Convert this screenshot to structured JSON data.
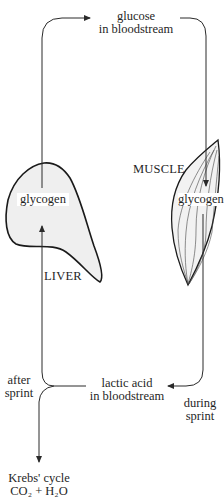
{
  "diagram": {
    "type": "Cori cycle",
    "colors": {
      "line": "#2a2a2a",
      "organ_fill": "#efefef",
      "background": "#ffffff"
    },
    "nodes": {
      "glucose": {
        "line1": "glucose",
        "line2": "in bloodstream"
      },
      "liver_glycogen": "glycogen",
      "liver_label": "LIVER",
      "muscle_label": "MUSCLE",
      "muscle_glycogen": "glycogen",
      "lactic_acid": {
        "line1": "lactic acid",
        "line2": "in bloodstream"
      },
      "krebs": {
        "line1": "Krebs' cycle",
        "line2": "CO₂ + H₂O"
      }
    },
    "edge_labels": {
      "after_sprint": {
        "line1": "after",
        "line2": "sprint"
      },
      "during_sprint": {
        "line1": "during",
        "line2": "sprint"
      }
    },
    "edges": [
      {
        "from": "liver_glycogen",
        "to": "glucose"
      },
      {
        "from": "glucose",
        "to": "muscle_glycogen"
      },
      {
        "from": "muscle_glycogen",
        "to": "lactic_acid",
        "label": "during sprint"
      },
      {
        "from": "lactic_acid",
        "to": "liver_glycogen",
        "label": "after sprint"
      },
      {
        "from": "lactic_acid",
        "to": "krebs",
        "label": "after sprint"
      }
    ]
  }
}
